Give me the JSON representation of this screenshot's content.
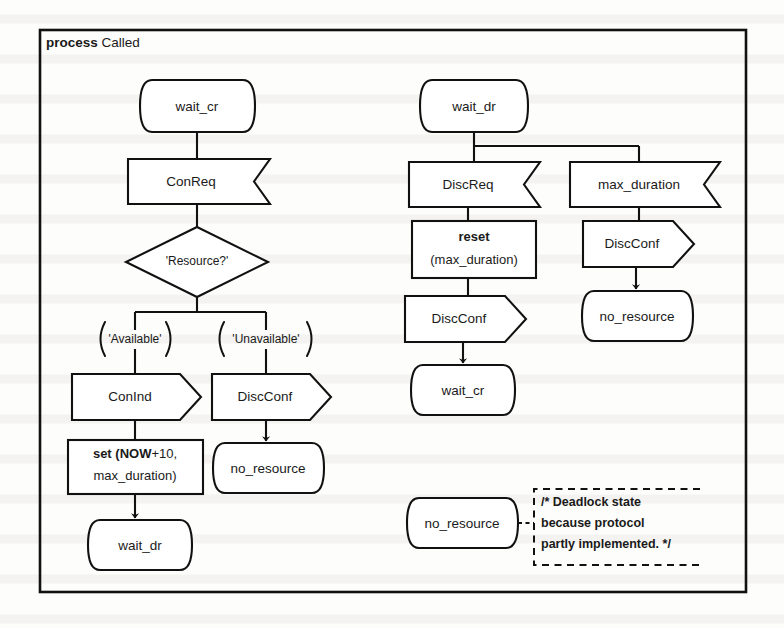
{
  "diagram": {
    "kind": "sdl-process-diagram",
    "header": {
      "keyword": "process",
      "name": "Called"
    },
    "ink_color": "#111111",
    "paper_color": "#fdfdfb",
    "branches": {
      "left": {
        "state_start": "wait_cr",
        "input": "ConReq",
        "decision": "'Resource?'",
        "option_left": "'Available'",
        "option_right": "'Unavailable'",
        "output_left": "ConInd",
        "task_bold": "set (NOW",
        "task_rest": "+10,",
        "task_line2": "max_duration)",
        "state_end_left": "wait_dr",
        "output_right": "DiscConf",
        "state_end_right": "no_resource"
      },
      "middle": {
        "state_start": "wait_dr",
        "input": "DiscReq",
        "task_bold": "reset",
        "task_line2": "(max_duration)",
        "output": "DiscConf",
        "state_end": "wait_cr"
      },
      "right": {
        "input": "max_duration",
        "output": "DiscConf",
        "state_end": "no_resource"
      },
      "deadlock": {
        "state": "no_resource",
        "comment_line1": "/* Deadlock state",
        "comment_line2": "because protocol",
        "comment_line3": "partly implemented. */"
      }
    }
  }
}
